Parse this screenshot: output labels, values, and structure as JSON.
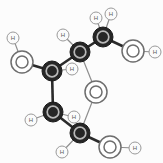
{
  "figure": {
    "type": "molecular-structure",
    "width": 163,
    "height": 163,
    "background_color": "#fcfcfc"
  },
  "legend": {
    "carbon_color": "#262626",
    "oxygen_color": "#ffffff",
    "oxygen_stroke": "#6e6e6e",
    "hydrogen_color": "#fbfbfb",
    "bond_color": "#4a4a4a"
  },
  "atoms": [
    {
      "id": "C1",
      "element": "C",
      "label": "",
      "x": 52,
      "y": 71,
      "r": 10
    },
    {
      "id": "C2",
      "element": "C",
      "label": "",
      "x": 80,
      "y": 52,
      "r": 10
    },
    {
      "id": "C3",
      "element": "C",
      "label": "",
      "x": 103,
      "y": 37,
      "r": 10
    },
    {
      "id": "C4",
      "element": "C",
      "label": "",
      "x": 53,
      "y": 112,
      "r": 10
    },
    {
      "id": "C5",
      "element": "C",
      "label": "",
      "x": 80,
      "y": 133,
      "r": 10
    },
    {
      "id": "O1",
      "element": "O",
      "label": "",
      "x": 22,
      "y": 62,
      "r": 11
    },
    {
      "id": "O2",
      "element": "O",
      "label": "",
      "x": 133,
      "y": 51,
      "r": 11
    },
    {
      "id": "O3",
      "element": "O",
      "label": "",
      "x": 96,
      "y": 92,
      "r": 11
    },
    {
      "id": "O4",
      "element": "O",
      "label": "",
      "x": 110,
      "y": 147,
      "r": 11
    },
    {
      "id": "H1",
      "element": "H",
      "label": "H",
      "x": 13,
      "y": 38,
      "r": 6
    },
    {
      "id": "H2",
      "element": "H",
      "label": "H",
      "x": 72,
      "y": 69,
      "r": 6
    },
    {
      "id": "H3",
      "element": "H",
      "label": "H",
      "x": 63,
      "y": 35,
      "r": 6
    },
    {
      "id": "H4",
      "element": "H",
      "label": "H",
      "x": 96,
      "y": 18,
      "r": 6
    },
    {
      "id": "H5",
      "element": "H",
      "label": "H",
      "x": 111,
      "y": 14,
      "r": 6
    },
    {
      "id": "H6",
      "element": "H",
      "label": "H",
      "x": 155,
      "y": 52,
      "r": 6
    },
    {
      "id": "H7",
      "element": "H",
      "label": "H",
      "x": 31,
      "y": 120,
      "r": 6
    },
    {
      "id": "H8",
      "element": "H",
      "label": "H",
      "x": 74,
      "y": 117,
      "r": 6
    },
    {
      "id": "H9",
      "element": "H",
      "label": "H",
      "x": 62,
      "y": 152,
      "r": 6
    },
    {
      "id": "H10",
      "element": "H",
      "label": "H",
      "x": 135,
      "y": 148,
      "r": 6
    }
  ],
  "bonds": [
    {
      "from": "C1",
      "to": "O1",
      "style": "thick"
    },
    {
      "from": "O1",
      "to": "H1",
      "style": "thin"
    },
    {
      "from": "C1",
      "to": "C2",
      "style": "thick"
    },
    {
      "from": "C1",
      "to": "H2",
      "style": "thin"
    },
    {
      "from": "C1",
      "to": "C4",
      "style": "thick"
    },
    {
      "from": "C2",
      "to": "H3",
      "style": "thin"
    },
    {
      "from": "C2",
      "to": "C3",
      "style": "thick"
    },
    {
      "from": "C2",
      "to": "O3",
      "style": "thin"
    },
    {
      "from": "C3",
      "to": "H4",
      "style": "thin"
    },
    {
      "from": "C3",
      "to": "H5",
      "style": "thin"
    },
    {
      "from": "C3",
      "to": "O2",
      "style": "thick"
    },
    {
      "from": "O2",
      "to": "H6",
      "style": "thin"
    },
    {
      "from": "C4",
      "to": "H7",
      "style": "thin"
    },
    {
      "from": "C4",
      "to": "H8",
      "style": "thin"
    },
    {
      "from": "C4",
      "to": "C5",
      "style": "thick"
    },
    {
      "from": "C5",
      "to": "H9",
      "style": "thin"
    },
    {
      "from": "C5",
      "to": "O3",
      "style": "thin"
    },
    {
      "from": "C5",
      "to": "O4",
      "style": "thick"
    },
    {
      "from": "O4",
      "to": "H10",
      "style": "thin"
    }
  ]
}
